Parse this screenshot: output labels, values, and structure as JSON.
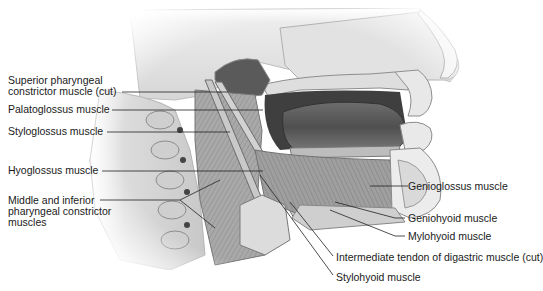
{
  "figure": {
    "colors": {
      "background": "#ffffff",
      "label_text": "#1a1a1a",
      "leader_line": "#222222",
      "bone_light": "#e9e9e9",
      "bone_shade": "#bdbdbd",
      "muscle": "#9a9a9a",
      "muscle_dark": "#6e6e6e",
      "tongue": "#5a5a5a",
      "cavity": "#3d3d3d"
    }
  },
  "labels": {
    "left": [
      {
        "id": "superior-pharyngeal",
        "text": "Superior pharyngeal\nconstrictor muscle (cut)"
      },
      {
        "id": "palatoglossus",
        "text": "Palatoglossus muscle"
      },
      {
        "id": "styloglossus",
        "text": "Styloglossus muscle"
      },
      {
        "id": "hyoglossus",
        "text": "Hyoglossus muscle"
      },
      {
        "id": "middle-inferior-pharyngeal",
        "text": "Middle and inferior\npharyngeal constrictor\nmuscles"
      }
    ],
    "right": [
      {
        "id": "genioglossus",
        "text": "Genioglossus muscle"
      },
      {
        "id": "geniohyoid",
        "text": "Geniohyoid muscle"
      },
      {
        "id": "mylohyoid",
        "text": "Mylohyoid muscle"
      },
      {
        "id": "intermediate-tendon",
        "text": "Intermediate tendon of digastric muscle (cut)"
      },
      {
        "id": "stylohyoid",
        "text": "Stylohyoid muscle"
      }
    ]
  }
}
